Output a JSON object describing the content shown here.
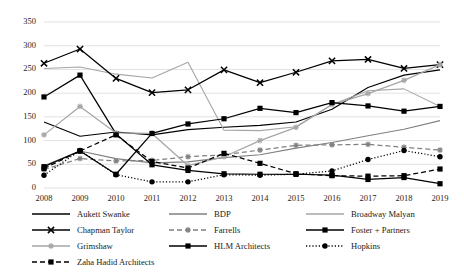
{
  "chart_data": {
    "type": "line",
    "title": "",
    "xlabel": "",
    "ylabel": "",
    "ylim": [
      0,
      350
    ],
    "ytick_step": 50,
    "yticks": [
      "0",
      "50",
      "100",
      "150",
      "200",
      "250",
      "300",
      "350"
    ],
    "grid": true,
    "grid_axis": "y",
    "legend_position": "bottom",
    "categories": [
      "2008",
      "2009",
      "2010",
      "2011",
      "2012",
      "2013",
      "2014",
      "2015",
      "2016",
      "2017",
      "2018",
      "2019"
    ],
    "series": [
      {
        "name": "Aukett Swanke",
        "color": "#000000",
        "style": "solid",
        "marker": "none",
        "values": [
          139,
          109,
          118,
          112,
          123,
          128,
          132,
          139,
          166,
          212,
          238,
          249
        ]
      },
      {
        "name": "BDP",
        "color": "#808080",
        "style": "solid",
        "marker": "none",
        "values": [
          47,
          78,
          62,
          53,
          55,
          64,
          70,
          84,
          96,
          110,
          124,
          142
        ]
      },
      {
        "name": "Broadway Malyan",
        "color": "#a6a6a6",
        "style": "solid",
        "marker": "none",
        "values": [
          252,
          255,
          240,
          232,
          265,
          122,
          121,
          129,
          176,
          205,
          209,
          172
        ]
      },
      {
        "name": "Chapman Taylor",
        "color": "#000000",
        "style": "solid",
        "marker": "x",
        "values": [
          263,
          293,
          231,
          201,
          207,
          249,
          222,
          244,
          268,
          271,
          252,
          260
        ]
      },
      {
        "name": "Farrells",
        "color": "#808080",
        "style": "dashed",
        "marker": "star",
        "values": [
          39,
          62,
          57,
          58,
          66,
          70,
          80,
          90,
          91,
          92,
          86,
          80
        ]
      },
      {
        "name": "Foster + Partners",
        "color": "#000000",
        "style": "solid",
        "marker": "square",
        "values": [
          192,
          238,
          114,
          49,
          37,
          30,
          29,
          29,
          27,
          18,
          22,
          9
        ]
      },
      {
        "name": "Grimshaw",
        "color": "#a6a6a6",
        "style": "solid",
        "marker": "star",
        "values": [
          112,
          172,
          116,
          115,
          47,
          66,
          100,
          128,
          176,
          199,
          227,
          260
        ]
      },
      {
        "name": "HLM Architects",
        "color": "#000000",
        "style": "solid",
        "marker": "square",
        "values": [
          45,
          78,
          29,
          115,
          135,
          146,
          168,
          159,
          180,
          173,
          162,
          172
        ]
      },
      {
        "name": "Hopkins",
        "color": "#000000",
        "style": "dotted",
        "marker": "circle",
        "values": [
          27,
          79,
          28,
          13,
          13,
          28,
          27,
          29,
          36,
          60,
          79,
          66
        ]
      },
      {
        "name": "Zaha Hadid Architects",
        "color": "#000000",
        "style": "dashed",
        "marker": "square",
        "values": [
          41,
          78,
          112,
          56,
          42,
          73,
          52,
          30,
          26,
          25,
          26,
          40
        ]
      }
    ]
  },
  "legend": {
    "rows": [
      [
        {
          "label": "Aukett Swanke",
          "series_index": 0
        },
        {
          "label": "BDP",
          "series_index": 1
        },
        {
          "label": "Broadway Malyan",
          "series_index": 2
        }
      ],
      [
        {
          "label": "Chapman Taylor",
          "series_index": 3
        },
        {
          "label": "Farrells",
          "series_index": 4
        },
        {
          "label": "Foster + Partners",
          "series_index": 5
        }
      ],
      [
        {
          "label": "Grimshaw",
          "series_index": 6
        },
        {
          "label": "HLM Architects",
          "series_index": 7
        },
        {
          "label": "Hopkins",
          "series_index": 8
        }
      ],
      [
        {
          "label": "Zaha Hadid Architects",
          "series_index": 9
        }
      ]
    ]
  },
  "colors": {
    "grid": "#d9d9d9",
    "text": "#262626",
    "background": "#ffffff"
  }
}
